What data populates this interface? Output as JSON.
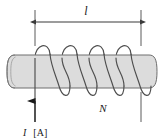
{
  "figure": {
    "labels": {
      "length": "l",
      "turns": "N",
      "current_symbol": "I",
      "current_unit": "[A]"
    },
    "colors": {
      "cylinder_fill": "#dcdcdc",
      "cylinder_stroke": "#6e6e6e",
      "wire_stroke": "#4d4d4d",
      "dimension_stroke": "#3a3a3a",
      "text": "#1a1a1a",
      "background": "#ffffff"
    },
    "geometry": {
      "dimension_line_y": 22,
      "dimension_left_x": 35,
      "dimension_right_x": 141,
      "cylinder_left_x": 8,
      "cylinder_right_x": 157,
      "cylinder_top_y": 55,
      "cylinder_bottom_y": 88,
      "coil_turns": 4,
      "current_lead_x": 35
    }
  }
}
